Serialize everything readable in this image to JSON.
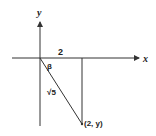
{
  "diagram": {
    "axes": {
      "x_label": "x",
      "y_label": "y"
    },
    "labels": {
      "horizontal_leg": "2",
      "angle": "β",
      "hypotenuse": "√5",
      "point": "(2, y)"
    },
    "colors": {
      "stroke": "#333333",
      "background": "#ffffff"
    }
  }
}
